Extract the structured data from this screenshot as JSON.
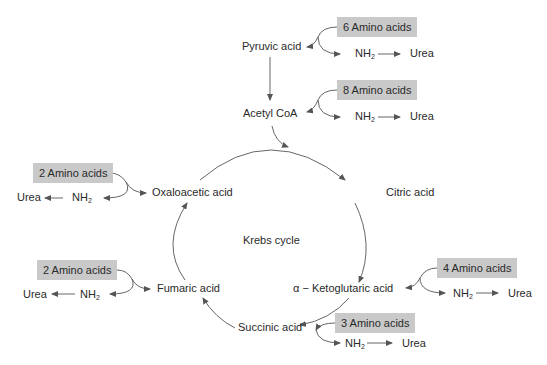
{
  "diagram": {
    "title": "Krebs cycle",
    "colors": {
      "box_fill": "#c9c9c9",
      "line": "#555555",
      "text": "#2a2a2a"
    },
    "metabolites": {
      "pyruvic": "Pyruvic acid",
      "acetyl": "Acetyl CoA",
      "oxaloacetic": "Oxaloacetic acid",
      "citric": "Citric acid",
      "fumaric": "Fumaric acid",
      "ketoglutaric_prefix": "α −",
      "ketoglutaric": "Ketoglutaric acid",
      "succinic": "Succinic acid"
    },
    "amino_inputs": [
      {
        "id": "pyruvic",
        "label": "6 Amino acids",
        "nh": "NH",
        "sub": "2",
        "urea": "Urea"
      },
      {
        "id": "acetyl",
        "label": "8 Amino acids",
        "nh": "NH",
        "sub": "2",
        "urea": "Urea"
      },
      {
        "id": "oxaloacetic",
        "label": "2 Amino acids",
        "nh": "NH",
        "sub": "2",
        "urea": "Urea"
      },
      {
        "id": "fumaric",
        "label": "2 Amino acids",
        "nh": "NH",
        "sub": "2",
        "urea": "Urea"
      },
      {
        "id": "ketoglutaric",
        "label": "4 Amino acids",
        "nh": "NH",
        "sub": "2",
        "urea": "Urea"
      },
      {
        "id": "succinic",
        "label": "3 Amino acids",
        "nh": "NH",
        "sub": "2",
        "urea": "Urea"
      }
    ]
  }
}
